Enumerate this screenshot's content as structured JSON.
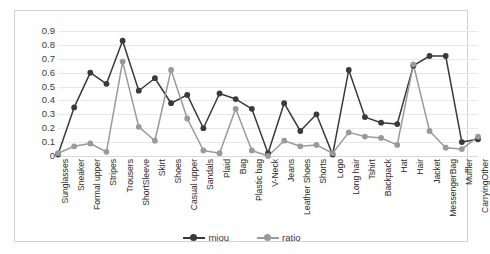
{
  "chart_data": {
    "type": "line",
    "title": "",
    "xlabel": "",
    "ylabel": "",
    "ylim": [
      0,
      0.9
    ],
    "grid": true,
    "legend_position": "bottom",
    "ytick_labels": [
      "0.9",
      "0.8",
      "0.7",
      "0.6",
      "0.5",
      "0.4",
      "0.3",
      "0.2",
      "0.1",
      "0"
    ],
    "ytick_values": [
      0.9,
      0.8,
      0.7,
      0.6,
      0.5,
      0.4,
      0.3,
      0.2,
      0.1,
      0
    ],
    "categories": [
      "Sunglasses",
      "Sneaker",
      "Formal upper",
      "Stripes",
      "Trousers",
      "ShortSleeve",
      "Skirt",
      "Shoes",
      "Casual upper",
      "Sandals",
      "Plaid",
      "Bag",
      "Plastic bag",
      "V-Neck",
      "Jeans",
      "Leather Shoes",
      "Shorts",
      "Logo",
      "Long hair",
      "Tshirt",
      "Backpack",
      "Hat",
      "Hair",
      "Jacket",
      "MessengerBag",
      "Muffler",
      "CarryingOther"
    ],
    "series": [
      {
        "name": "miou",
        "color": "#3a3a3a",
        "values": [
          0.01,
          0.35,
          0.6,
          0.52,
          0.83,
          0.47,
          0.56,
          0.38,
          0.44,
          0.2,
          0.45,
          0.41,
          0.34,
          0.02,
          0.38,
          0.18,
          0.3,
          0.01,
          0.62,
          0.28,
          0.24,
          0.23,
          0.65,
          0.72,
          0.72,
          0.1,
          0.12
        ]
      },
      {
        "name": "ratio",
        "color": "#9a9a9a",
        "values": [
          0.02,
          0.07,
          0.09,
          0.03,
          0.68,
          0.21,
          0.11,
          0.62,
          0.27,
          0.04,
          0.02,
          0.34,
          0.04,
          0.0,
          0.11,
          0.07,
          0.08,
          0.02,
          0.17,
          0.14,
          0.13,
          0.08,
          0.66,
          0.18,
          0.06,
          0.05,
          0.14
        ]
      }
    ]
  },
  "legend": {
    "items": [
      {
        "label": "miou"
      },
      {
        "label": "ratio"
      }
    ]
  }
}
